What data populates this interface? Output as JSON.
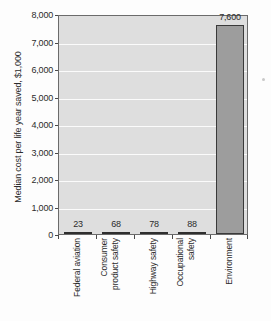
{
  "chart_data": {
    "type": "bar",
    "title": "",
    "xlabel": "",
    "ylabel": "Median cost per life year saved, $1,000",
    "categories": [
      "Federal aviation",
      "Consumer product safety",
      "Highway safety",
      "Occupational safety",
      "Environment"
    ],
    "values": [
      23,
      68,
      78,
      88,
      7600
    ],
    "value_labels": [
      "23",
      "68",
      "78",
      "88",
      "7,600"
    ],
    "ylim": [
      0,
      8000
    ],
    "ytick_values": [
      0,
      1000,
      2000,
      3000,
      4000,
      5000,
      6000,
      7000,
      8000
    ],
    "ytick_labels": [
      "0",
      "1,000",
      "2,000",
      "3,000",
      "4,000",
      "5,000",
      "6,000",
      "7,000",
      "8,000"
    ],
    "grid": true,
    "legend": "none",
    "colors": {
      "plot_background": "#dedede",
      "gridline": "#fbfbfb",
      "bar_fill": "#9d9d9d",
      "bar_edge": "#3a3a3a",
      "small_bar_fill": "#555555",
      "axis": "#6b6b6b",
      "text": "#2b2b2b"
    }
  },
  "x_category_lines": [
    [
      "Federal aviation"
    ],
    [
      "Consumer",
      "product safety"
    ],
    [
      "Highway safety"
    ],
    [
      "Occupational",
      "safety"
    ],
    [
      "Environment"
    ]
  ]
}
